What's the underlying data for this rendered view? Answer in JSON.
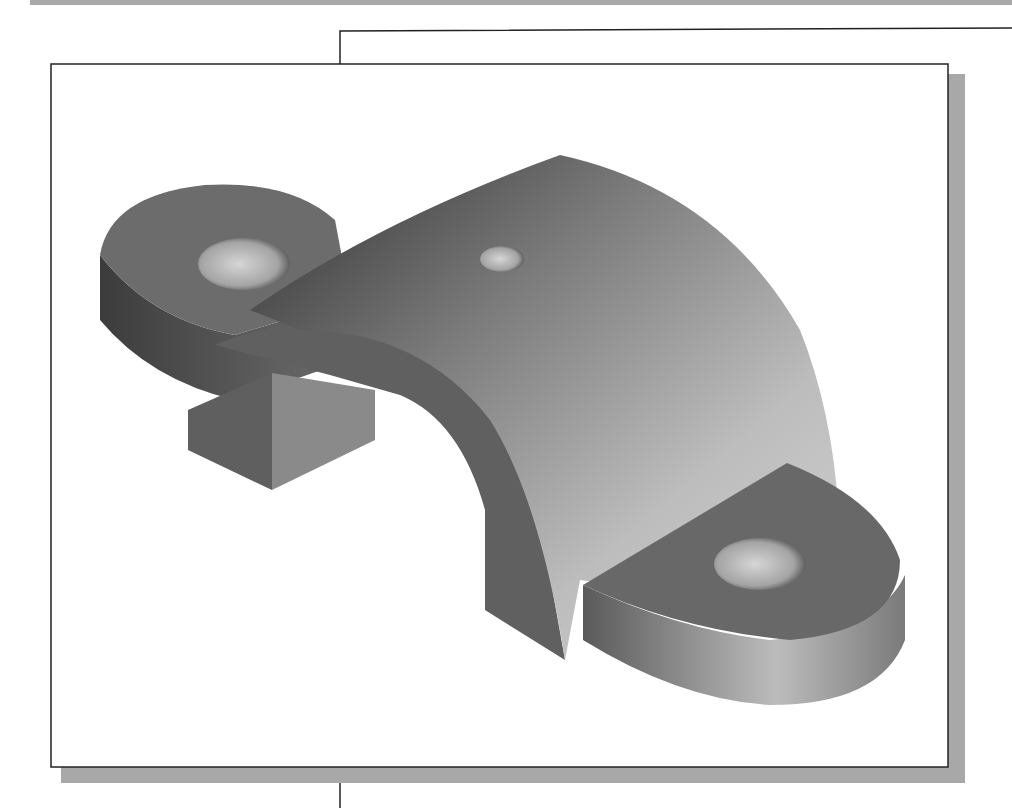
{
  "figure": {
    "components": [
      {
        "name": "left-mounting-lug",
        "features": [
          "through-hole"
        ]
      },
      {
        "name": "half-cylinder-arch",
        "features": [
          "small-top-hole"
        ]
      },
      {
        "name": "right-mounting-lug",
        "features": [
          "through-hole"
        ]
      }
    ],
    "colors": {
      "frame_border": "#222222",
      "frame_shadow": "#a8a8a8",
      "top_bar": "#a9a9a9",
      "part_dark": "#3a3a3a",
      "part_mid": "#6e6e6e",
      "part_light": "#c8c8c8",
      "background": "#ffffff"
    }
  }
}
